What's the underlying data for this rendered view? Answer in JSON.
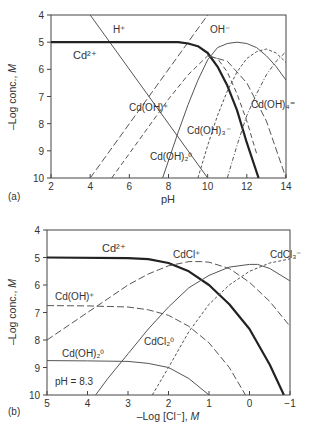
{
  "chart_data": [
    {
      "panel": "(a)",
      "type": "line",
      "title": "",
      "xlabel": "pH",
      "ylabel": "–Log conc., M",
      "xlim": [
        2,
        14
      ],
      "ylim": [
        4,
        10
      ],
      "y_inverted": true,
      "xticks": [
        2,
        4,
        6,
        8,
        10,
        12,
        14
      ],
      "yticks": [
        4,
        5,
        6,
        7,
        8,
        9,
        10
      ],
      "grid": false,
      "legend": "inline labels",
      "series": [
        {
          "name": "H+",
          "style": "solid-thin",
          "x": [
            2,
            4,
            10
          ],
          "y": [
            2,
            4,
            10
          ]
        },
        {
          "name": "OH-",
          "style": "dash-long",
          "x": [
            4,
            10
          ],
          "y": [
            10,
            4
          ]
        },
        {
          "name": "Cd2+",
          "style": "solid-bold",
          "x": [
            2,
            8.5,
            9,
            9.5,
            10,
            10.5,
            11,
            11.5,
            12,
            12.6
          ],
          "y": [
            5,
            5,
            5.05,
            5.15,
            5.4,
            5.9,
            6.6,
            7.5,
            8.7,
            10
          ]
        },
        {
          "name": "Cd(OH)+",
          "style": "dash-medium",
          "x": [
            5.1,
            7,
            8,
            9,
            10,
            10.5,
            11,
            11.5,
            12,
            12.5
          ],
          "y": [
            10,
            8.1,
            7.1,
            6.2,
            5.5,
            5.6,
            6.1,
            6.9,
            7.9,
            9.1
          ]
        },
        {
          "name": "Cd(OH)2 0",
          "style": "solid-thin",
          "x": [
            7.7,
            8.5,
            9,
            9.5,
            10,
            10.5,
            11,
            11.5,
            12,
            12.5,
            13,
            13.5,
            14
          ],
          "y": [
            10,
            8.3,
            7.3,
            6.4,
            5.65,
            5.2,
            5.05,
            5.0,
            5.05,
            5.2,
            5.5,
            5.9,
            6.4
          ]
        },
        {
          "name": "Cd(OH)3-",
          "style": "dash-short",
          "x": [
            9.5,
            10,
            10.5,
            11,
            11.5,
            12,
            12.5,
            13,
            13.5,
            14
          ],
          "y": [
            10,
            8.8,
            7.7,
            6.8,
            6.1,
            5.6,
            5.35,
            5.25,
            5.4,
            5.75
          ]
        },
        {
          "name": "Cd(OH)4 2-",
          "style": "dash-dot",
          "x": [
            11,
            11.5,
            12,
            12.5,
            13,
            13.5,
            14
          ],
          "y": [
            10,
            8.8,
            7.7,
            6.9,
            6.2,
            5.7,
            5.35
          ]
        },
        {
          "name": "Cd(OH)+ right",
          "style": "dash-long",
          "x": [
            10,
            11,
            12,
            13,
            14
          ],
          "y": [
            5.5,
            5.7,
            6.5,
            7.9,
            10
          ]
        }
      ],
      "annotations": [
        "H⁺",
        "OH⁻",
        "Cd²⁺",
        "Cd(OH)⁺",
        "Cd(OH)₃⁻",
        "Cd(OH)₂⁰",
        "Cd(OH)₄²⁻"
      ]
    },
    {
      "panel": "(b)",
      "type": "line",
      "title": "",
      "xlabel": "–Log [Cl⁻], M",
      "ylabel": "–Log conc., M",
      "xlim": [
        5,
        -1
      ],
      "ylim": [
        4,
        10
      ],
      "y_inverted": true,
      "xticks": [
        5,
        4,
        3,
        2,
        1,
        0,
        -1
      ],
      "yticks": [
        4,
        5,
        6,
        7,
        8,
        9,
        10
      ],
      "grid": false,
      "legend": "inline labels",
      "annotation_text": "pH = 8.3",
      "series": [
        {
          "name": "Cd2+",
          "style": "solid-bold",
          "x": [
            5,
            3,
            2.5,
            2,
            1.5,
            1,
            0.5,
            0,
            -0.5,
            -0.85
          ],
          "y": [
            5,
            5.02,
            5.06,
            5.2,
            5.5,
            6.0,
            6.7,
            7.6,
            8.9,
            10
          ]
        },
        {
          "name": "CdCl+",
          "style": "dash-long",
          "x": [
            5,
            4,
            3.5,
            3,
            2.5,
            2,
            1.5,
            1.2,
            1,
            0.5,
            0,
            -0.5,
            -1
          ],
          "y": [
            8,
            7.0,
            6.5,
            6.0,
            5.6,
            5.3,
            5.15,
            5.15,
            5.17,
            5.4,
            5.9,
            6.6,
            7.5
          ]
        },
        {
          "name": "Cd(OH)+",
          "style": "dash-long",
          "x": [
            5,
            4,
            3,
            2.5,
            2,
            1.5,
            1,
            0.5,
            0.1
          ],
          "y": [
            6.75,
            6.76,
            6.8,
            6.9,
            7.1,
            7.5,
            8.1,
            9.0,
            10
          ]
        },
        {
          "name": "CdCl2 0",
          "style": "solid-thin",
          "x": [
            3.8,
            3.5,
            3,
            2.5,
            2,
            1.5,
            1,
            0.5,
            0,
            -0.2,
            -0.5,
            -1
          ],
          "y": [
            10,
            9.4,
            8.5,
            7.6,
            6.8,
            6.1,
            5.65,
            5.35,
            5.25,
            5.25,
            5.4,
            5.85
          ]
        },
        {
          "name": "CdCl3-",
          "style": "dash-short",
          "x": [
            2.4,
            2,
            1.5,
            1,
            0.5,
            0,
            -0.5,
            -1
          ],
          "y": [
            10,
            9.0,
            7.7,
            6.7,
            6.0,
            5.5,
            5.2,
            5.05
          ]
        },
        {
          "name": "Cd(OH)2 0",
          "style": "solid-thin",
          "x": [
            5,
            4,
            3,
            2.5,
            2,
            1.5,
            1
          ],
          "y": [
            8.75,
            8.76,
            8.78,
            8.85,
            9.0,
            9.4,
            10
          ]
        }
      ],
      "annotations": [
        "Cd²⁺",
        "CdCl⁺",
        "CdCl₃⁻",
        "Cd(OH)⁺",
        "CdCl₂⁰",
        "Cd(OH)₂⁰"
      ]
    }
  ],
  "panels": {
    "a": {
      "tag": "(a)",
      "xlabel": "pH",
      "ylabel_main": "–Log conc., ",
      "ylabel_unit": "M",
      "labels": {
        "h": "H⁺",
        "oh": "OH⁻",
        "cd": "Cd²⁺",
        "cdoh": "Cd(OH)⁺",
        "cdoh3": "Cd(OH)₃⁻",
        "cdoh2": "Cd(OH)₂⁰",
        "cdoh4": "Cd(OH)₄⁼"
      }
    },
    "b": {
      "tag": "(b)",
      "xlabel_main": "–Log [Cl⁻], ",
      "xlabel_unit": "M",
      "ylabel_main": "–Log conc., ",
      "ylabel_unit": "M",
      "ph_note": "pH = 8.3",
      "labels": {
        "cd": "Cd²⁺",
        "cdcl": "CdCl⁺",
        "cdcl3": "CdCl₃⁻",
        "cdoh": "Cd(OH)⁺",
        "cdcl2": "CdCl₂⁰",
        "cdoh2": "Cd(OH)₂⁰"
      }
    }
  }
}
